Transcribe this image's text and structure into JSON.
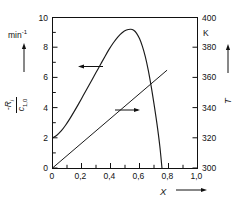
{
  "chart_data": {
    "type": "line",
    "title": "",
    "xlabel": "X",
    "ylabel_left_numerator": "-R",
    "ylabel_left_numerator_sub": "i",
    "ylabel_left_denominator": "c",
    "ylabel_left_denominator_sub": "1,0",
    "ylabel_left_unit": "min",
    "ylabel_left_unit_exponent": "-1",
    "ylabel_right": "T",
    "ylabel_right_unit": "K",
    "xlim": [
      0,
      1.0
    ],
    "ylim_left": [
      0,
      10
    ],
    "ylim_right": [
      300,
      400
    ],
    "grid": false,
    "legend": "none",
    "x_ticks": [
      "0",
      "0,2",
      "0,4",
      "0,6",
      "0,8",
      "1,0"
    ],
    "x_tick_values": [
      0,
      0.2,
      0.4,
      0.6,
      0.8,
      1.0
    ],
    "y_left_ticks": [
      "0",
      "2",
      "4",
      "6",
      "8",
      "10"
    ],
    "y_left_tick_values": [
      0,
      2,
      4,
      6,
      8,
      10
    ],
    "y_right_ticks": [
      "300",
      "320",
      "340",
      "360",
      "380",
      "400"
    ],
    "y_right_tick_values": [
      300,
      320,
      340,
      360,
      380,
      400
    ],
    "series": [
      {
        "name": "reaction-rate-curve",
        "axis": "left",
        "arrow_direction": "left",
        "x": [
          0.0,
          0.03,
          0.06,
          0.09,
          0.12,
          0.15,
          0.18,
          0.21,
          0.24,
          0.27,
          0.3,
          0.33,
          0.36,
          0.39,
          0.42,
          0.45,
          0.48,
          0.51,
          0.54,
          0.56,
          0.58,
          0.6,
          0.62,
          0.64,
          0.66,
          0.68,
          0.7,
          0.72,
          0.74,
          0.755
        ],
        "values": [
          2.0,
          2.18,
          2.46,
          2.84,
          3.28,
          3.76,
          4.26,
          4.78,
          5.3,
          5.82,
          6.34,
          6.86,
          7.38,
          7.88,
          8.32,
          8.7,
          8.99,
          9.17,
          9.22,
          9.15,
          8.95,
          8.6,
          8.08,
          7.4,
          6.52,
          5.46,
          4.26,
          2.96,
          1.46,
          0.0
        ]
      },
      {
        "name": "temperature-line",
        "axis": "right",
        "arrow_direction": "right",
        "x": [
          0.0,
          0.79
        ],
        "values": [
          300,
          365
        ]
      }
    ],
    "annotations": [
      {
        "name": "rate-curve-arrow",
        "points": "left",
        "x": 0.27,
        "y_left": 6.6
      },
      {
        "name": "temperature-line-arrow",
        "points": "right",
        "x": 0.52,
        "y_left": 3.8
      }
    ],
    "colors": {
      "axis": "#111111",
      "curve": "#1a1a1a",
      "line": "#1a1a1a",
      "background": "#ffffff"
    }
  }
}
